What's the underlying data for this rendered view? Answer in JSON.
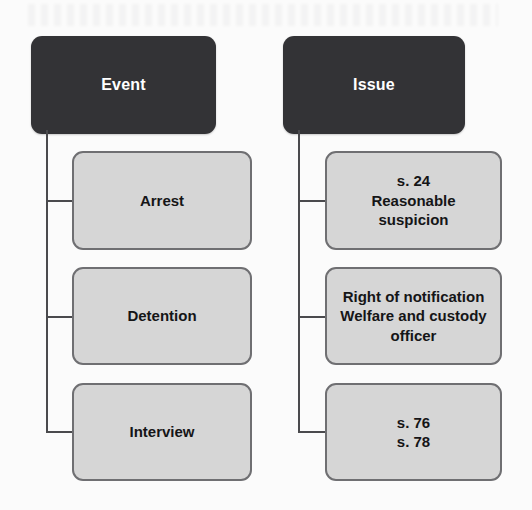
{
  "diagram": {
    "type": "two-column-tree",
    "background_color": "#fbfbfb",
    "header_color": "#333336",
    "node_color": "#d6d6d6",
    "line_color": "#4a4a4d",
    "columns": [
      {
        "key": "event",
        "header": "Event",
        "nodes": [
          {
            "key": "arrest",
            "label": "Arrest"
          },
          {
            "key": "detention",
            "label": "Detention"
          },
          {
            "key": "interview",
            "label": "Interview"
          }
        ]
      },
      {
        "key": "issue",
        "header": "Issue",
        "nodes": [
          {
            "key": "s24",
            "label": "s. 24\nReasonable\nsuspicion"
          },
          {
            "key": "welfare",
            "label": "Right of notification\nWelfare and custody\nofficer"
          },
          {
            "key": "s76s78",
            "label": "s. 76\ns. 78"
          }
        ]
      }
    ]
  }
}
